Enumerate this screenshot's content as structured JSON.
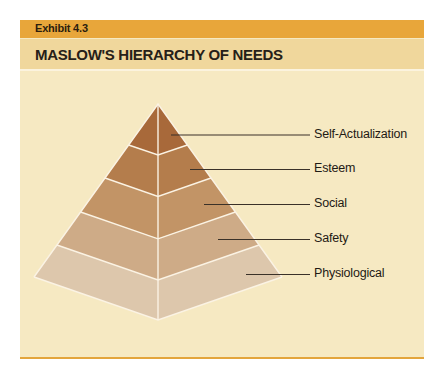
{
  "exhibit": {
    "label": "Exhibit 4.3",
    "title": "MASLOW'S HIERARCHY OF NEEDS"
  },
  "colors": {
    "exhibit_bar": "#e8a63a",
    "title_bar": "#f0d79c",
    "panel_background": "#f6e9c2",
    "bottom_rule": "#e3a53c",
    "divider_lines": "#fbf3e4",
    "leader_lines": "#3a3128"
  },
  "pyramid": {
    "levels": [
      {
        "name": "Self-Actualization",
        "order": 1,
        "position": "top",
        "color": "#a8693a"
      },
      {
        "name": "Esteem",
        "order": 2,
        "position": "second",
        "color": "#b47d4c"
      },
      {
        "name": "Social",
        "order": 3,
        "position": "middle",
        "color": "#c29466"
      },
      {
        "name": "Safety",
        "order": 4,
        "position": "fourth",
        "color": "#ceab87"
      },
      {
        "name": "Physiological",
        "order": 5,
        "position": "base",
        "color": "#ddc7ac"
      }
    ]
  }
}
